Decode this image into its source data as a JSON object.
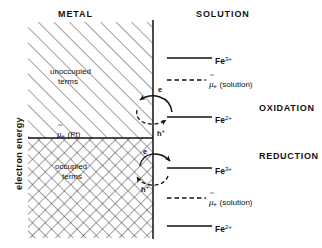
{
  "figure": {
    "type": "energy-level-diagram",
    "headers": {
      "left": "METAL",
      "right": "SOLUTION"
    },
    "axis": {
      "ylabel": "electron energy"
    },
    "metal": {
      "upper_region_label_line1": "unoccupied",
      "upper_region_label_line2": "terms",
      "lower_region_label_line1": "occupied",
      "lower_region_label_line2": "terms",
      "fermi_label_mu": "μ",
      "fermi_label_sub": "e",
      "fermi_label_paren": "(Pt)"
    },
    "solution_levels": [
      {
        "id": "fe3-top",
        "style": "solid",
        "label_main": "Fe",
        "label_sup": "3+",
        "y": 58
      },
      {
        "id": "mu-top",
        "style": "dashed",
        "label_main": "μ",
        "label_sub": "e",
        "label_paren": "(solution)",
        "y": 80
      },
      {
        "id": "fe2-top",
        "style": "solid",
        "label_main": "Fe",
        "label_sup": "2+",
        "y": 117
      },
      {
        "id": "fe3-bot",
        "style": "solid",
        "label_main": "Fe",
        "label_sup": "3+",
        "y": 168
      },
      {
        "id": "mu-bot",
        "style": "dashed",
        "label_main": "μ",
        "label_sub": "e",
        "label_paren": "(solution)",
        "y": 198
      },
      {
        "id": "fe2-bot",
        "style": "solid",
        "label_main": "Fe",
        "label_sup": "2+",
        "y": 226
      }
    ],
    "processes": [
      {
        "id": "oxidation",
        "label": "OXIDATION",
        "electron_label": "e",
        "hole_label": "h",
        "hole_sup": "+",
        "electron_direction": "to-metal",
        "hole_direction": "to-solution"
      },
      {
        "id": "reduction",
        "label": "REDUCTION",
        "electron_label": "e",
        "hole_label": "h",
        "hole_sup": "+",
        "electron_direction": "to-solution",
        "hole_direction": "to-metal"
      }
    ],
    "colors": {
      "ink": "#111111",
      "background": "#ffffff"
    }
  }
}
